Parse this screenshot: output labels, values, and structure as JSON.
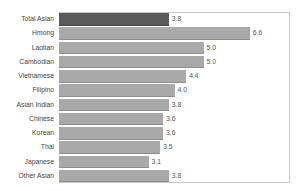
{
  "chart_data": {
    "type": "bar",
    "orientation": "horizontal",
    "title": "",
    "xlabel": "",
    "ylabel": "",
    "categories": [
      "Total Asian",
      "Hmong",
      "Laotian",
      "Cambodian",
      "Vietnamese",
      "Filipino",
      "Asian Indian",
      "Chinese",
      "Korean",
      "Thai",
      "Japanese",
      "Other Asian"
    ],
    "values": [
      3.8,
      6.6,
      5.0,
      5.0,
      4.4,
      4.0,
      3.8,
      3.6,
      3.6,
      3.5,
      3.1,
      3.8
    ],
    "value_labels": [
      "3.8",
      "6.6",
      "5.0",
      "5.0",
      "4.4",
      "4.0",
      "3.8",
      "3.6",
      "3.6",
      "3.5",
      "3.1",
      "3.8"
    ],
    "highlight_index": 0,
    "colors": {
      "highlight": "#5a5a5a",
      "default": "#a9a9a9"
    },
    "grid": false,
    "legend": null,
    "xlim": [
      0,
      8
    ]
  }
}
